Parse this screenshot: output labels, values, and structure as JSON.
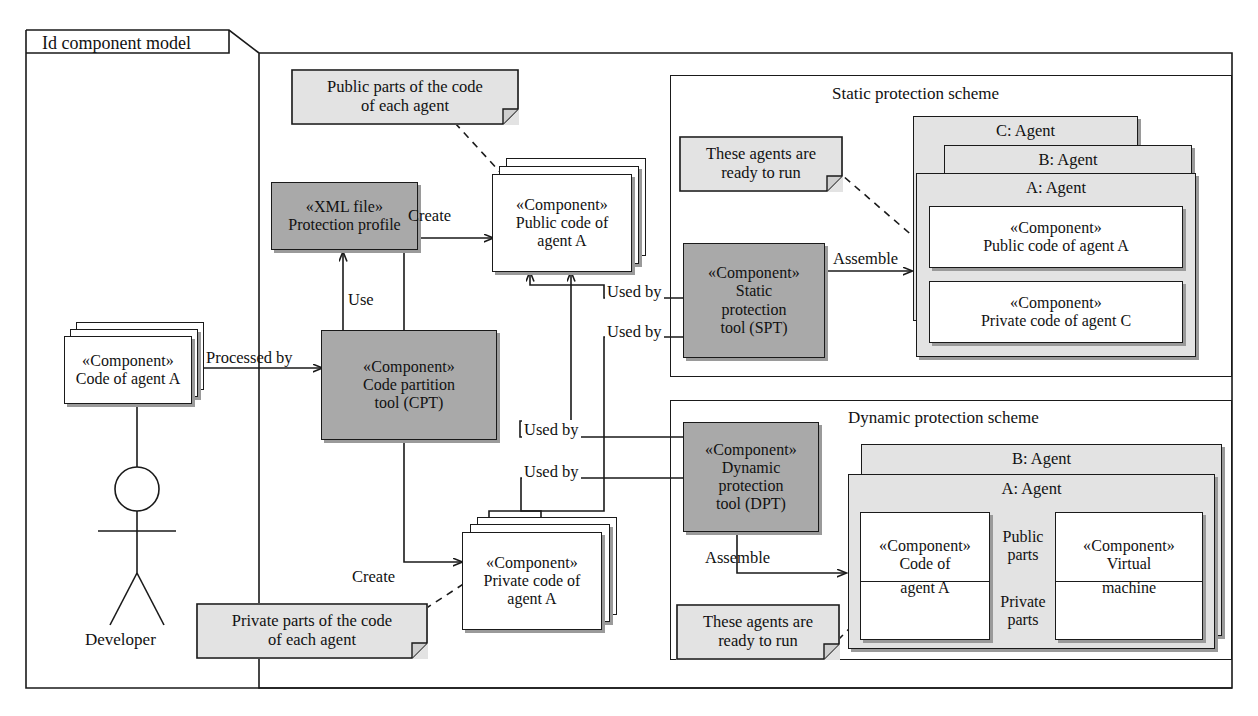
{
  "diagram": {
    "title": "Id component model",
    "kind": "uml-component-diagram"
  },
  "actor": {
    "label": "Developer",
    "icon": "actor-stick-figure-icon"
  },
  "components": {
    "code_of_agent_a": {
      "stereotype": "«Component»",
      "name": "Code of agent A",
      "fill": "#ffffff",
      "stacked": true
    },
    "protection_profile": {
      "stereotype": "«XML file»",
      "name": "Protection profile",
      "fill": "#a9a9a9"
    },
    "cpt": {
      "stereotype": "«Component»",
      "name_line1": "Code partition",
      "name_line2": "tool (CPT)",
      "fill": "#a9a9a9"
    },
    "public_code_of_agent_a": {
      "stereotype": "«Component»",
      "name_line1": "Public code of",
      "name_line2": "agent A",
      "fill": "#ffffff",
      "stacked": true
    },
    "private_code_of_agent_a": {
      "stereotype": "«Component»",
      "name_line1": "Private code of",
      "name_line2": "agent A",
      "fill": "#ffffff",
      "stacked": true
    },
    "spt": {
      "stereotype": "«Component»",
      "name_line1": "Static",
      "name_line2": "protection",
      "name_line3": "tool (SPT)",
      "fill": "#a9a9a9"
    },
    "dpt": {
      "stereotype": "«Component»",
      "name_line1": "Dynamic",
      "name_line2": "protection",
      "name_line3": "tool (DPT)",
      "fill": "#a9a9a9"
    },
    "static_public_code": {
      "stereotype": "«Component»",
      "name": "Public code of agent A",
      "fill": "#ffffff"
    },
    "static_private_code": {
      "stereotype": "«Component»",
      "name": "Private code of agent C",
      "fill": "#ffffff"
    },
    "dyn_code_of_agent_a": {
      "stereotype": "«Component»",
      "name_line1": "Code of",
      "name_line2": "agent A",
      "fill": "#ffffff"
    },
    "dyn_virtual_machine": {
      "stereotype": "«Component»",
      "name_line1": "Virtual",
      "name_line2": "machine",
      "fill": "#ffffff"
    }
  },
  "frames": {
    "static_scheme": {
      "title": "Static protection scheme"
    },
    "dynamic_scheme": {
      "title": "Dynamic protection scheme"
    }
  },
  "agents": {
    "static": [
      {
        "label": "C: Agent"
      },
      {
        "label": "B: Agent"
      },
      {
        "label": "A: Agent"
      }
    ],
    "dynamic": [
      {
        "label": "B: Agent"
      },
      {
        "label": "A: Agent"
      }
    ]
  },
  "ports": {
    "public_parts_line1": "Public",
    "public_parts_line2": "parts",
    "private_parts_line1": "Private",
    "private_parts_line2": "parts"
  },
  "notes": [
    {
      "id": "note-public-parts",
      "line1": "Public parts of the code",
      "line2": "of each agent"
    },
    {
      "id": "note-static-ready",
      "line1": "These agents are",
      "line2": "ready to run"
    },
    {
      "id": "note-private-parts",
      "line1": "Private parts of the code",
      "line2": "of each agent"
    },
    {
      "id": "note-dynamic-ready",
      "line1": "These agents are",
      "line2": "ready to run"
    }
  ],
  "edge_labels": {
    "processed_by": "Processed by",
    "use": "Use",
    "create_public": "Create",
    "create_private": "Create",
    "used_by_1": "Used by",
    "used_by_2": "Used by",
    "used_by_3": "Used by",
    "used_by_4": "Used by",
    "assemble_static": "Assemble",
    "assemble_dynamic": "Assemble"
  },
  "colors": {
    "stroke": "#1a1a1a",
    "shadow": "#9a9a9a",
    "fill_light": "#e3e3e3",
    "fill_dark": "#a9a9a9",
    "background": "#ffffff"
  }
}
